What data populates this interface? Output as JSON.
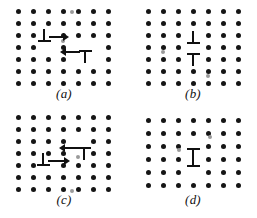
{
  "figure": {
    "background_color": "#ffffff",
    "atom_color": "#151515",
    "symbol_color": "#101010",
    "width": 257,
    "height": 218,
    "panel_count": 4
  },
  "panels": [
    {
      "id": "a",
      "label": "(a)",
      "position": {
        "left": 0,
        "top": 0
      },
      "label_position": {
        "top": 86
      },
      "lattice": {
        "rows": 7,
        "cols": 7,
        "origin": {
          "x": 18,
          "y": 11
        },
        "spacing": {
          "x": 15,
          "y": 12
        }
      },
      "lattice_note": "square array of atoms with local distortion near dislocation cores",
      "dislocations": [
        {
          "name": "positive-edge-dislocation",
          "symbol": "perpendicular-up",
          "glyph": "⊥",
          "x": 44,
          "y": 40,
          "arrow": {
            "direction": "right",
            "length": 15,
            "offset_x": 5,
            "offset_y": -4
          }
        },
        {
          "name": "negative-edge-dislocation",
          "symbol": "perpendicular-down",
          "glyph": "⊤",
          "x": 85,
          "y": 52,
          "arrow": {
            "direction": "left",
            "length": 15,
            "offset_x": -20,
            "offset_y": -1
          }
        }
      ],
      "faint_atoms": [
        {
          "x": 63,
          "y": 41
        },
        {
          "x": 72,
          "y": 12
        }
      ]
    },
    {
      "id": "b",
      "label": "(b)",
      "position": {
        "left": 129,
        "top": 0
      },
      "label_position": {
        "top": 86
      },
      "lattice": {
        "rows": 7,
        "cols": 7,
        "origin": {
          "x": 19,
          "y": 11
        },
        "spacing": {
          "x": 15,
          "y": 12
        }
      },
      "lattice_note": "dislocations have met; cores stacked vertically",
      "dislocations": [
        {
          "name": "positive-edge-dislocation",
          "symbol": "perpendicular-up",
          "glyph": "⊥",
          "x": 64,
          "y": 42,
          "arrow": null
        },
        {
          "name": "negative-edge-dislocation",
          "symbol": "perpendicular-down",
          "glyph": "⊤",
          "x": 64,
          "y": 55,
          "arrow": null
        }
      ],
      "faint_atoms": [
        {
          "x": 34,
          "y": 52
        },
        {
          "x": 79,
          "y": 76
        }
      ]
    },
    {
      "id": "c",
      "label": "(c)",
      "position": {
        "left": 0,
        "top": 109
      },
      "label_position": {
        "top": 83
      },
      "lattice": {
        "rows": 7,
        "cols": 7,
        "origin": {
          "x": 18,
          "y": 8
        },
        "spacing": {
          "x": 15,
          "y": 12
        }
      },
      "lattice_note": "opposite-sign dislocations on neighbouring glide planes approaching",
      "dislocations": [
        {
          "name": "negative-edge-dislocation",
          "symbol": "perpendicular-down",
          "glyph": "⊤",
          "x": 84,
          "y": 40,
          "arrow": {
            "direction": "left",
            "length": 15,
            "offset_x": -20,
            "offset_y": -2
          }
        },
        {
          "name": "positive-edge-dislocation",
          "symbol": "perpendicular-up",
          "glyph": "⊥",
          "x": 43,
          "y": 55,
          "arrow": {
            "direction": "right",
            "length": 17,
            "offset_x": 5,
            "offset_y": -4
          }
        }
      ],
      "faint_atoms": [
        {
          "x": 78,
          "y": 48
        },
        {
          "x": 72,
          "y": 82
        }
      ]
    },
    {
      "id": "d",
      "label": "(d)",
      "position": {
        "left": 129,
        "top": 109
      },
      "label_position": {
        "top": 83
      },
      "lattice": {
        "rows": 6,
        "cols": 7,
        "origin": {
          "x": 19,
          "y": 11
        },
        "spacing": {
          "x": 15,
          "y": 13
        }
      },
      "lattice_note": "dislocation dipole formed; row of vacancies left behind",
      "dislocations": [
        {
          "name": "negative-edge-dislocation",
          "symbol": "perpendicular-down",
          "glyph": "⊤",
          "x": 64,
          "y": 41,
          "arrow": null
        },
        {
          "name": "positive-edge-dislocation",
          "symbol": "perpendicular-up",
          "glyph": "⊥",
          "x": 64,
          "y": 56,
          "arrow": null
        }
      ],
      "faint_atoms": [
        {
          "x": 50,
          "y": 41
        },
        {
          "x": 81,
          "y": 28
        }
      ]
    }
  ]
}
